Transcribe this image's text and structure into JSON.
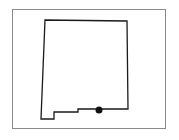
{
  "map": {
    "subject": "New Mexico state outline",
    "frame_color": "#8a8a8a",
    "outline_color": "#1a1a1a",
    "outline_points": "45,20 127,21 128,109 78,109 78,112 54,112 54,119 41,119",
    "marker": {
      "label": "location-marker",
      "cx": 99,
      "cy": 110,
      "r": 3.5,
      "color": "#111111"
    }
  }
}
